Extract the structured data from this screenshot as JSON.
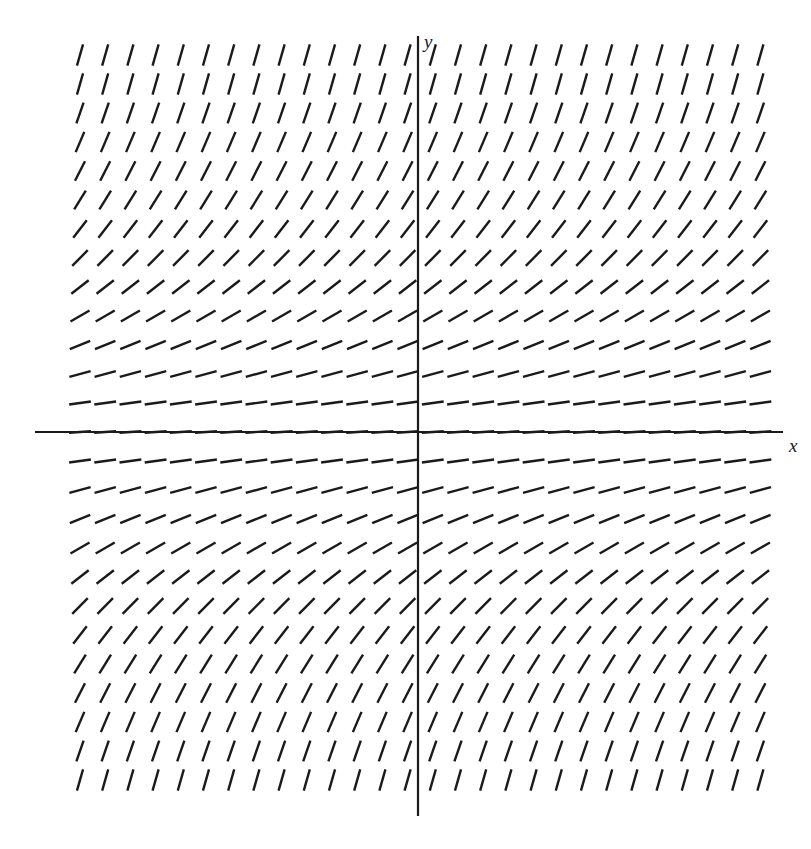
{
  "figure": {
    "name": "slope-field-diagram",
    "type": "direction-field",
    "background_color": "#ffffff",
    "ink_color": "#1a1a1a"
  },
  "axes": {
    "x_label": "x",
    "y_label": "y",
    "x_axis": {
      "y_pixel": 432,
      "x_start": 35,
      "x_end": 783,
      "stroke_width": 2.2
    },
    "y_axis": {
      "x_pixel": 418,
      "y_start": 36,
      "y_end": 816,
      "stroke_width": 2.2
    },
    "origin": {
      "x": 418,
      "y": 432
    }
  },
  "chart_data": {
    "type": "scatter",
    "title": "",
    "xlabel": "x",
    "ylabel": "y",
    "grid": false,
    "legend": null,
    "axis_origin_px": {
      "x": 418,
      "y": 432
    },
    "grid_spacing_px": {
      "x": 25.2,
      "y": 29.0
    },
    "columns": 28,
    "rows_above_axis": 13,
    "rows_below_axis": 13,
    "first_column_x_px": 80,
    "dash_length_px": 22,
    "dash_stroke_width": 2.4,
    "row_angles_deg_by_distance": [
      5,
      9,
      15,
      22,
      30,
      38,
      45,
      52,
      58,
      63,
      67,
      71,
      74
    ],
    "rows": [
      {
        "index": -13,
        "y_px": 55,
        "angle_deg": 74
      },
      {
        "index": -12,
        "y_px": 84,
        "angle_deg": 74
      },
      {
        "index": -11,
        "y_px": 113,
        "angle_deg": 71
      },
      {
        "index": -10,
        "y_px": 142,
        "angle_deg": 67
      },
      {
        "index": -9,
        "y_px": 171,
        "angle_deg": 63
      },
      {
        "index": -8,
        "y_px": 200,
        "angle_deg": 58
      },
      {
        "index": -7,
        "y_px": 229,
        "angle_deg": 52
      },
      {
        "index": -6,
        "y_px": 258,
        "angle_deg": 45
      },
      {
        "index": -5,
        "y_px": 287,
        "angle_deg": 38
      },
      {
        "index": -4,
        "y_px": 316,
        "angle_deg": 30
      },
      {
        "index": -3,
        "y_px": 345,
        "angle_deg": 22
      },
      {
        "index": -2,
        "y_px": 374,
        "angle_deg": 15
      },
      {
        "index": -1,
        "y_px": 403,
        "angle_deg": 8
      },
      {
        "index": 0,
        "y_px": 432,
        "angle_deg": 4
      },
      {
        "index": 1,
        "y_px": 461,
        "angle_deg": 8
      },
      {
        "index": 2,
        "y_px": 490,
        "angle_deg": 15
      },
      {
        "index": 3,
        "y_px": 519,
        "angle_deg": 22
      },
      {
        "index": 4,
        "y_px": 548,
        "angle_deg": 30
      },
      {
        "index": 5,
        "y_px": 577,
        "angle_deg": 38
      },
      {
        "index": 6,
        "y_px": 606,
        "angle_deg": 45
      },
      {
        "index": 7,
        "y_px": 635,
        "angle_deg": 52
      },
      {
        "index": 8,
        "y_px": 664,
        "angle_deg": 58
      },
      {
        "index": 9,
        "y_px": 693,
        "angle_deg": 63
      },
      {
        "index": 10,
        "y_px": 722,
        "angle_deg": 67
      },
      {
        "index": 11,
        "y_px": 751,
        "angle_deg": 71
      },
      {
        "index": 12,
        "y_px": 780,
        "angle_deg": 74
      }
    ]
  }
}
